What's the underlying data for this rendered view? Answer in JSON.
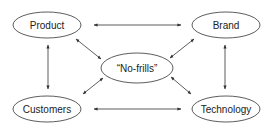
{
  "diagram": {
    "nodes": [
      {
        "id": "product",
        "label": "Product",
        "cx": 47,
        "cy": 25,
        "rx": 34,
        "ry": 13
      },
      {
        "id": "brand",
        "label": "Brand",
        "cx": 226,
        "cy": 25,
        "rx": 34,
        "ry": 13
      },
      {
        "id": "no-frills",
        "label": "“No-frills”",
        "cx": 137,
        "cy": 68,
        "rx": 36,
        "ry": 15
      },
      {
        "id": "customers",
        "label": "Customers",
        "cx": 47,
        "cy": 109,
        "rx": 34,
        "ry": 13
      },
      {
        "id": "technology",
        "label": "Technology",
        "cx": 226,
        "cy": 109,
        "rx": 34,
        "ry": 13
      }
    ],
    "edges": [
      {
        "from": "product",
        "to": "brand",
        "direction": "both"
      },
      {
        "from": "customers",
        "to": "technology",
        "direction": "both"
      },
      {
        "from": "product",
        "to": "customers",
        "direction": "both"
      },
      {
        "from": "brand",
        "to": "technology",
        "direction": "both"
      },
      {
        "from": "product",
        "to": "no-frills",
        "direction": "both"
      },
      {
        "from": "brand",
        "to": "no-frills",
        "direction": "both"
      },
      {
        "from": "customers",
        "to": "no-frills",
        "direction": "both"
      },
      {
        "from": "technology",
        "to": "no-frills",
        "direction": "both"
      }
    ],
    "colors": {
      "stroke": "#333333",
      "text": "#222222",
      "background": "#ffffff"
    }
  }
}
